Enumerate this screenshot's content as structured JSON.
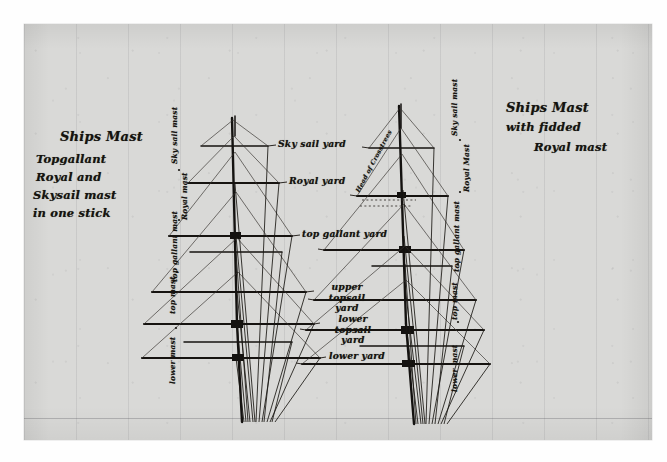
{
  "document": {
    "medium": "pen-and-ink drawing on ruled paper, photographed",
    "subject": "Ships mast rigging comparison diagram"
  },
  "captions": {
    "left": {
      "title": "Ships Mast",
      "lines": [
        "Topgallant",
        "Royal and",
        "Skysail mast",
        "in one stick"
      ]
    },
    "right": {
      "line1": "Ships Mast",
      "line2": "with fidded",
      "line3": "Royal mast"
    }
  },
  "yard_labels": [
    {
      "id": "skysail",
      "line1": "Sky sail yard",
      "line2": ""
    },
    {
      "id": "royal",
      "line1": "Royal yard",
      "line2": ""
    },
    {
      "id": "topgallant",
      "line1": "top gallant yard",
      "line2": ""
    },
    {
      "id": "upper-topsail",
      "line1": "upper topsail",
      "line2": "yard"
    },
    {
      "id": "lower-topsail",
      "line1": "lower topsail",
      "line2": "yard"
    },
    {
      "id": "lower",
      "line1": "lower yard",
      "line2": ""
    }
  ],
  "left_mast_labels": [
    {
      "id": "skysail-mast",
      "text": "Sky sail mast"
    },
    {
      "id": "royal-mast",
      "text": "Royal mast"
    },
    {
      "id": "topgallant-mast",
      "text": "top gallant mast"
    },
    {
      "id": "topmast",
      "text": "top mast"
    },
    {
      "id": "lower-mast",
      "text": "lower mast"
    }
  ],
  "right_mast_labels": [
    {
      "id": "skysail-mast",
      "text": "Sky sail mast"
    },
    {
      "id": "royal-mast",
      "text": "Royal Mast"
    },
    {
      "id": "topgallant-mast",
      "text": "top gallant mast"
    },
    {
      "id": "topmast",
      "text": "top mast"
    },
    {
      "id": "lower-mast",
      "text": "lower mast"
    }
  ],
  "annotations": {
    "crosstrees": "Head of Crosstrees"
  },
  "colors": {
    "paper": "#d9d9d7",
    "ink": "#15130f",
    "faint_rule": "#787880",
    "surround": "#fefefe"
  }
}
